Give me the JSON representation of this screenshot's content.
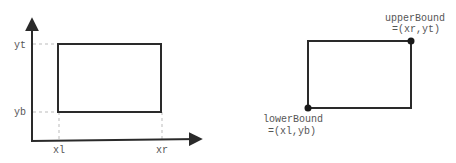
{
  "left_diagram": {
    "axis_labels": {
      "yt": "yt",
      "yb": "yb",
      "xl": "xl",
      "xr": "xr"
    }
  },
  "right_diagram": {
    "upper_bound": {
      "name": "upperBound",
      "value": "=(xr,yt)"
    },
    "lower_bound": {
      "name": "lowerBound",
      "value": "=(xl,yb)"
    }
  },
  "colors": {
    "stroke": "#2a2a2a",
    "dashed": "#bbbbbb",
    "label": "#555555"
  }
}
